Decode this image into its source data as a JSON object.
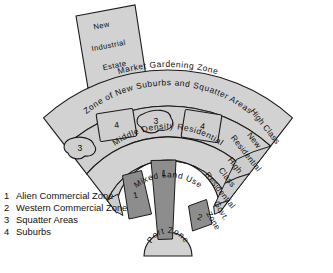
{
  "diagram": {
    "center": {
      "x": 168,
      "y": 256
    },
    "colors": {
      "ring_fill": "#d2d2d2",
      "sub_fill": "#cccccc",
      "dark_wedge": "#8d8d8d",
      "outline": "#1a1a1a",
      "background": "#ffffff"
    },
    "external": {
      "industrial_estate": {
        "lines": [
          "New",
          "Industrial",
          "Estate"
        ],
        "label": "New Industrial Estate"
      }
    },
    "rings": [
      {
        "name": "market-gardening-zone",
        "label": "Market Gardening Zone",
        "r_inner": 151,
        "r_outer": 186
      },
      {
        "name": "zone-of-new-suburbs-and-squatter-areas",
        "label": "Zone of New Suburbs and Squatter Areas",
        "r_inner": 108,
        "r_outer": 151
      },
      {
        "name": "middle-density-residential",
        "label": "Middle Density Residential",
        "r_inner": 66,
        "r_outer": 108
      },
      {
        "name": "mixed-land-use",
        "label": "Mixed Land Use",
        "r_inner": 24,
        "r_outer": 66
      },
      {
        "name": "port-zone",
        "label": "Port Zone",
        "r_inner": 0,
        "r_outer": 24
      }
    ],
    "right_sectors": [
      {
        "name": "high-class-new-residential",
        "label": "High Class New Residential",
        "lines": [
          "High Class",
          "New",
          "Residential"
        ]
      },
      {
        "name": "high-class-residential",
        "label": "High Class Residential",
        "lines": [
          "High",
          "Class",
          "Residential"
        ]
      },
      {
        "name": "govt-zone",
        "label": "Govt. Zone",
        "lines": [
          "Govt.",
          "Zone"
        ]
      }
    ],
    "markers": [
      {
        "name": "squatter-blob-left",
        "value": "3",
        "shape": "blob"
      },
      {
        "name": "suburb-box-left",
        "value": "4",
        "shape": "rect"
      },
      {
        "name": "squatter-blob-right",
        "value": "3",
        "shape": "blob"
      },
      {
        "name": "suburb-box-right",
        "value": "4",
        "shape": "rect"
      },
      {
        "name": "alien-commercial-wedge-left",
        "value": "1",
        "shape": "wedge"
      },
      {
        "name": "alien-commercial-wedge-center",
        "value": "1",
        "shape": "wedge"
      },
      {
        "name": "western-commercial-wedge",
        "value": "2",
        "shape": "wedge"
      }
    ]
  },
  "legend": {
    "items": [
      {
        "num": "1",
        "label": "Alien Commercial Zone"
      },
      {
        "num": "2",
        "label": "Western Commercial Zone"
      },
      {
        "num": "3",
        "label": "Squatter Areas"
      },
      {
        "num": "4",
        "label": "Suburbs"
      }
    ]
  }
}
